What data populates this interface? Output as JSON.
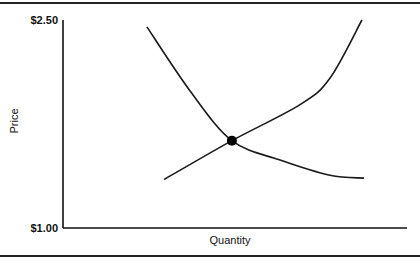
{
  "chart_data": {
    "type": "line",
    "title": "",
    "xlabel": "Quantity",
    "ylabel": "Price",
    "ylim": [
      1.0,
      2.5
    ],
    "xlim": [
      0,
      10
    ],
    "y_ticks": [
      {
        "value": 1.0,
        "label": "$1.00"
      },
      {
        "value": 2.5,
        "label": "$2.50"
      }
    ],
    "grid": false,
    "series": [
      {
        "name": "Demand",
        "points": [
          [
            2.44,
            2.45
          ],
          [
            3.69,
            1.99
          ],
          [
            4.91,
            1.63
          ],
          [
            6.31,
            1.49
          ],
          [
            7.76,
            1.38
          ],
          [
            8.75,
            1.36
          ]
        ]
      },
      {
        "name": "Supply",
        "points": [
          [
            2.94,
            1.35
          ],
          [
            4.91,
            1.63
          ],
          [
            6.89,
            1.89
          ],
          [
            7.76,
            2.08
          ],
          [
            8.69,
            2.5
          ]
        ]
      }
    ],
    "annotations": [
      {
        "type": "point",
        "name": "equilibrium",
        "x": 4.91,
        "y": 1.63
      }
    ]
  }
}
